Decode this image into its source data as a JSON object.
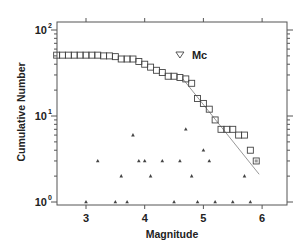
{
  "chart_data": {
    "type": "scatter",
    "title": "",
    "xlabel": "Magnitude",
    "ylabel": "Cumulative Number",
    "xlim": [
      2.5,
      6.4
    ],
    "ylim": [
      1,
      100
    ],
    "yscale": "log",
    "x_ticks": [
      3,
      4,
      5,
      6
    ],
    "x_tick_labels": [
      "3",
      "4",
      "5",
      "6"
    ],
    "y_ticks": [
      1,
      10,
      100
    ],
    "y_tick_labels": [
      {
        "base": "10",
        "exp": "0"
      },
      {
        "base": "10",
        "exp": "1"
      },
      {
        "base": "10",
        "exp": "2"
      }
    ],
    "grid": false,
    "legend": null,
    "series": [
      {
        "name": "Cumulative number",
        "marker": "square",
        "x": [
          2.5,
          2.6,
          2.7,
          2.8,
          2.9,
          3.0,
          3.1,
          3.2,
          3.3,
          3.4,
          3.5,
          3.6,
          3.7,
          3.8,
          3.9,
          4.0,
          4.1,
          4.2,
          4.3,
          4.4,
          4.5,
          4.6,
          4.7,
          4.8,
          4.9,
          5.0,
          5.1,
          5.2,
          5.3,
          5.4,
          5.5,
          5.6,
          5.7,
          5.8,
          5.9
        ],
        "values": [
          51,
          51,
          51,
          51,
          51,
          51,
          51,
          51,
          50,
          50,
          49,
          46,
          46,
          46,
          43,
          40,
          37,
          34,
          32,
          29,
          29,
          28,
          27,
          24,
          16,
          14,
          12,
          9,
          7,
          7,
          7,
          6,
          6,
          4,
          3
        ]
      },
      {
        "name": "Incremental number",
        "marker": "triangle",
        "x": [
          3.0,
          3.2,
          3.5,
          3.6,
          3.7,
          3.8,
          3.9,
          4.0,
          4.1,
          4.3,
          4.5,
          4.6,
          4.7,
          4.8,
          4.9,
          5.0,
          5.1,
          5.2,
          5.5,
          5.7,
          5.8
        ],
        "values": [
          1,
          3,
          1,
          2,
          1,
          6,
          3,
          3,
          2,
          3,
          1,
          3,
          7,
          2,
          1,
          4,
          3,
          1,
          1,
          2,
          1
        ]
      },
      {
        "name": "G-R fit",
        "marker": "line",
        "x": [
          4.65,
          5.95
        ],
        "values": [
          27,
          2.1
        ]
      }
    ],
    "annotations": [
      {
        "text": "Mc",
        "marker": "inverted-triangle",
        "x": 4.6,
        "y": 46
      }
    ],
    "highlighted_point": {
      "x": 5.9,
      "y": 3,
      "note": "square with inner mark"
    }
  },
  "labels": {
    "xlabel": "Magnitude",
    "ylabel": "Cumulative Number",
    "mc": "Mc"
  }
}
